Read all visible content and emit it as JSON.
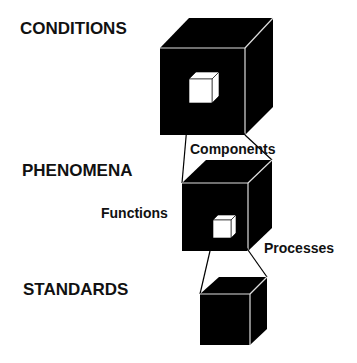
{
  "levels": [
    {
      "label": "CONDITIONS"
    },
    {
      "label": "PHENOMENA"
    },
    {
      "label": "STANDARDS"
    }
  ],
  "connectors": {
    "components": "Components",
    "functions": "Functions",
    "processes": "Processes"
  },
  "colors": {
    "cube_fill": "#000000",
    "edge": "#e8e8e8",
    "inner_cube": "#ffffff",
    "text": "#111111"
  }
}
